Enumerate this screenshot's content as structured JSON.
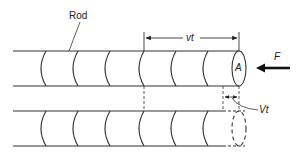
{
  "diagram": {
    "labels": {
      "rod": "Rod",
      "vt": "vt",
      "area": "A",
      "force": "F",
      "Vt": "Vt"
    },
    "colors": {
      "stroke": "#333333",
      "background": "#ffffff"
    }
  }
}
